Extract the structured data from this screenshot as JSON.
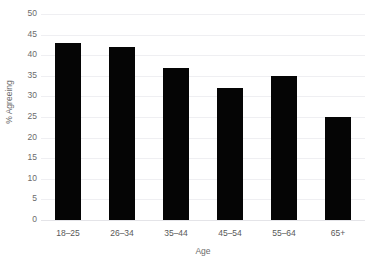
{
  "chart_data": {
    "type": "bar",
    "title": "",
    "subtitle": "",
    "categories": [
      "18–25",
      "26–34",
      "35–44",
      "45–54",
      "55–64",
      "65+"
    ],
    "values": [
      43,
      42,
      37,
      32,
      35,
      25
    ],
    "series": [
      {
        "name": "% Agreeing",
        "values": [
          43,
          42,
          37,
          32,
          35,
          25
        ]
      }
    ],
    "xlabel": "Age",
    "ylabel": "% Agreeing",
    "ylim": [
      0,
      50
    ],
    "ytick_step": 5,
    "ytick_labels": [
      "0",
      "5",
      "10",
      "15",
      "20",
      "25",
      "30",
      "35",
      "40",
      "45",
      "50"
    ],
    "grid": true,
    "grid_axis": "y",
    "legend": false,
    "legend_position": "none",
    "bar_color": "#050505",
    "grid_color": "#efeff2",
    "axis_color": "#e4e4e8",
    "text_color": "#595959",
    "background_color": "#ffffff",
    "annotations": []
  },
  "axes": {
    "x_title": "Age",
    "y_title": "% Agreeing"
  },
  "title_strip": {
    "text": ""
  }
}
